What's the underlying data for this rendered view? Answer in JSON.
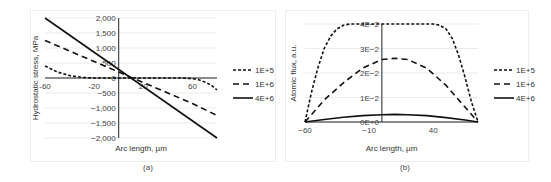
{
  "chart_data": [
    {
      "id": "a",
      "type": "line",
      "caption": "(a)",
      "title": "",
      "xlabel": "Arc length, µm",
      "ylabel": "Hydrostatic stress, MPa",
      "xlim": [
        -60,
        80
      ],
      "ylim": [
        -2000,
        2000
      ],
      "xticks": [
        -60,
        -20,
        20,
        60
      ],
      "xtick_labels": [
        "-60",
        "-20",
        "20",
        "60"
      ],
      "yticks": [
        -2000,
        -1500,
        -1000,
        -500,
        0,
        500,
        1000,
        1500,
        2000
      ],
      "ytick_labels": [
        "−2,000",
        "−1,500",
        "−1,000",
        "−500",
        "0",
        "500",
        "1,000",
        "1,500",
        "2,000"
      ],
      "grid": true,
      "legend_position": "right",
      "series": [
        {
          "name": "1E+5",
          "style": "short-dash",
          "x": [
            -60,
            -50,
            -40,
            -30,
            -20,
            -10,
            0,
            10,
            20,
            30,
            40,
            50,
            60,
            65,
            70,
            75,
            80
          ],
          "y": [
            400,
            200,
            80,
            20,
            0,
            0,
            0,
            0,
            0,
            0,
            0,
            0,
            -20,
            -60,
            -130,
            -230,
            -400
          ]
        },
        {
          "name": "1E+6",
          "style": "long-dash",
          "x": [
            -60,
            -40,
            -20,
            0,
            10,
            20,
            40,
            60,
            80
          ],
          "y": [
            1250,
            900,
            550,
            200,
            20,
            -150,
            -500,
            -850,
            -1250
          ]
        },
        {
          "name": "4E+6",
          "style": "solid",
          "x": [
            -60,
            80
          ],
          "y": [
            2000,
            -2000
          ]
        }
      ]
    },
    {
      "id": "b",
      "type": "line",
      "caption": "(b)",
      "title": "",
      "xlabel": "Arc length, µm",
      "ylabel": "Atomic flux, a.u.",
      "xlim": [
        -60,
        75
      ],
      "ylim": [
        0,
        0.04
      ],
      "xticks": [
        -60,
        -10,
        40
      ],
      "xtick_labels": [
        "−60",
        "−10",
        "40"
      ],
      "yticks": [
        0,
        0.01,
        0.02,
        0.03,
        0.04
      ],
      "ytick_labels": [
        "0E+0",
        "1E−2",
        "2E−2",
        "3E−2",
        "4E−2"
      ],
      "grid": true,
      "legend_position": "right",
      "series": [
        {
          "name": "1E+5",
          "style": "short-dash",
          "x": [
            -60,
            -55,
            -50,
            -45,
            -40,
            -35,
            -30,
            -25,
            -20,
            0,
            20,
            40,
            45,
            50,
            55,
            60,
            65,
            70,
            75
          ],
          "y": [
            0,
            0.012,
            0.022,
            0.03,
            0.035,
            0.038,
            0.0395,
            0.04,
            0.04,
            0.04,
            0.04,
            0.04,
            0.0395,
            0.038,
            0.034,
            0.027,
            0.018,
            0.008,
            0
          ]
        },
        {
          "name": "1E+6",
          "style": "long-dash",
          "x": [
            -60,
            -45,
            -30,
            -15,
            0,
            10,
            20,
            35,
            50,
            65,
            75
          ],
          "y": [
            0,
            0.009,
            0.016,
            0.022,
            0.0255,
            0.026,
            0.0255,
            0.022,
            0.015,
            0.006,
            0
          ]
        },
        {
          "name": "4E+6",
          "style": "solid",
          "x": [
            -60,
            -45,
            -30,
            -15,
            0,
            10,
            20,
            35,
            50,
            65,
            75
          ],
          "y": [
            0,
            0.001,
            0.0019,
            0.0026,
            0.003,
            0.0031,
            0.003,
            0.0026,
            0.0018,
            0.0008,
            0
          ]
        }
      ]
    }
  ]
}
